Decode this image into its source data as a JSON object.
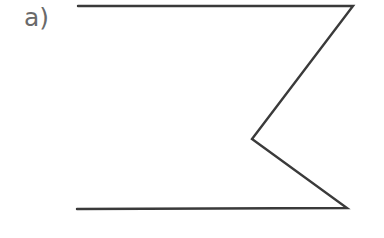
{
  "figure": {
    "label": "a)",
    "stroke_color": "#3a3a3a",
    "label_color": "#6a6a6a",
    "shape": "zigzag-open-polyline",
    "points": [
      [
        78,
        6
      ],
      [
        353,
        6
      ],
      [
        252,
        139
      ],
      [
        347,
        208
      ],
      [
        77,
        209
      ]
    ]
  }
}
